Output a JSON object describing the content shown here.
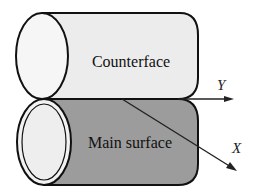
{
  "diagram": {
    "title": "",
    "components": {
      "counterface": {
        "label": "Counterface",
        "fill": "#eeeeee"
      },
      "main_surface": {
        "label": "Main surface",
        "fill": "#9a9a9a"
      }
    },
    "axes": {
      "y": {
        "label": "Y"
      },
      "x": {
        "label": "X"
      }
    },
    "colors": {
      "stroke": "#111111",
      "end_cap_fill": "#f2f2f2",
      "background": "#ffffff"
    }
  }
}
